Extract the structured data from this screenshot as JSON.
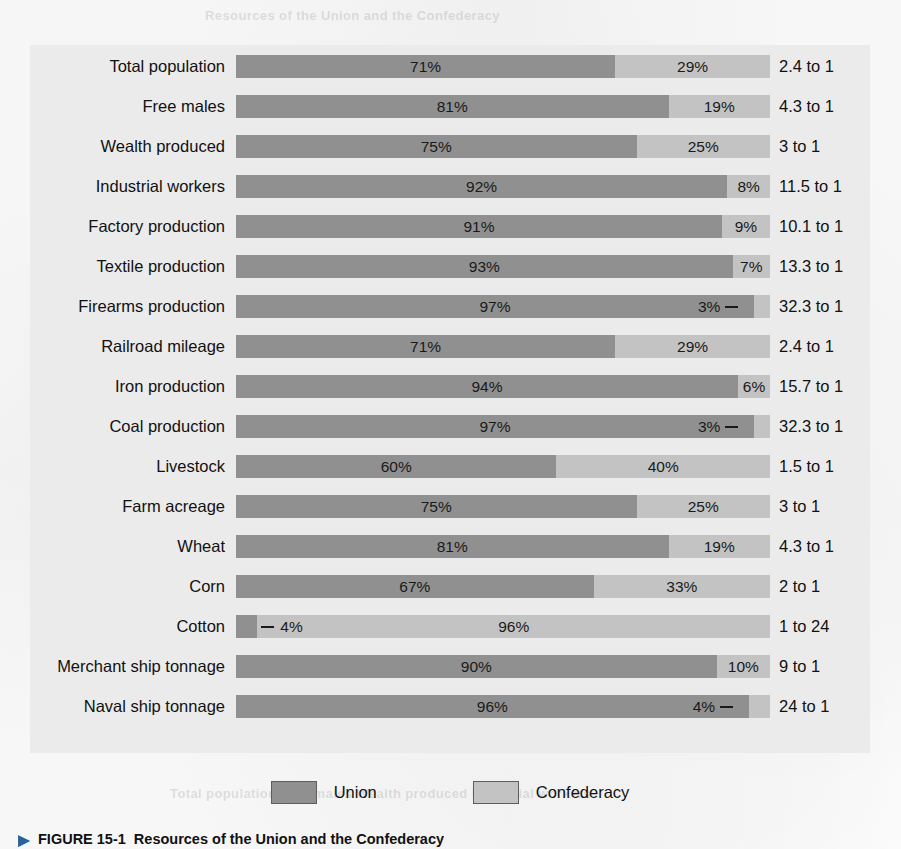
{
  "chart_data": {
    "type": "bar",
    "subtype": "stacked-horizontal-100percent",
    "title": "Resources of the Union and the Confederacy",
    "xlabel": "",
    "ylabel": "",
    "xlim": [
      0,
      100
    ],
    "grid": false,
    "legend_position": "bottom-center",
    "categories": [
      "Total population",
      "Free males",
      "Wealth produced",
      "Industrial workers",
      "Factory production",
      "Textile production",
      "Firearms production",
      "Railroad mileage",
      "Iron production",
      "Coal production",
      "Livestock",
      "Farm acreage",
      "Wheat",
      "Corn",
      "Cotton",
      "Merchant ship tonnage",
      "Naval ship tonnage"
    ],
    "series": [
      {
        "name": "Union",
        "color": "#909090",
        "values": [
          71,
          81,
          75,
          92,
          91,
          93,
          97,
          71,
          94,
          97,
          60,
          75,
          81,
          67,
          4,
          90,
          96
        ]
      },
      {
        "name": "Confederacy",
        "color": "#c3c3c3",
        "values": [
          29,
          19,
          25,
          8,
          9,
          7,
          3,
          29,
          6,
          3,
          40,
          25,
          19,
          33,
          96,
          10,
          4
        ]
      }
    ],
    "ratios": [
      "2.4 to 1",
      "4.3 to 1",
      "3 to 1",
      "11.5 to 1",
      "10.1 to 1",
      "13.3 to 1",
      "32.3 to 1",
      "2.4 to 1",
      "15.7 to 1",
      "32.3 to 1",
      "1.5 to 1",
      "3 to 1",
      "4.3 to 1",
      "2 to 1",
      "1 to 24",
      "9 to 1",
      "24 to 1"
    ]
  },
  "rows": [
    {
      "label": "Total population",
      "union": 71,
      "conf": 29,
      "union_pct_text": "71%",
      "conf_pct_text": "29%",
      "ratio": "2.4 to 1",
      "union_label_outside": false,
      "conf_label_outside": false,
      "conf_leader": false,
      "union_leader": false
    },
    {
      "label": "Free males",
      "union": 81,
      "conf": 19,
      "union_pct_text": "81%",
      "conf_pct_text": "19%",
      "ratio": "4.3 to 1",
      "union_label_outside": false,
      "conf_label_outside": false,
      "conf_leader": false,
      "union_leader": false
    },
    {
      "label": "Wealth produced",
      "union": 75,
      "conf": 25,
      "union_pct_text": "75%",
      "conf_pct_text": "25%",
      "ratio": "3 to 1",
      "union_label_outside": false,
      "conf_label_outside": false,
      "conf_leader": false,
      "union_leader": false
    },
    {
      "label": "Industrial workers",
      "union": 92,
      "conf": 8,
      "union_pct_text": "92%",
      "conf_pct_text": "8%",
      "ratio": "11.5 to 1",
      "union_label_outside": false,
      "conf_label_outside": false,
      "conf_leader": false,
      "union_leader": false
    },
    {
      "label": "Factory production",
      "union": 91,
      "conf": 9,
      "union_pct_text": "91%",
      "conf_pct_text": "9%",
      "ratio": "10.1 to 1",
      "union_label_outside": false,
      "conf_label_outside": false,
      "conf_leader": false,
      "union_leader": false
    },
    {
      "label": "Textile production",
      "union": 93,
      "conf": 7,
      "union_pct_text": "93%",
      "conf_pct_text": "7%",
      "ratio": "13.3 to 1",
      "union_label_outside": false,
      "conf_label_outside": false,
      "conf_leader": false,
      "union_leader": false
    },
    {
      "label": "Firearms production",
      "union": 97,
      "conf": 3,
      "union_pct_text": "97%",
      "conf_pct_text": "3%",
      "ratio": "32.3 to 1",
      "union_label_outside": false,
      "conf_label_outside": true,
      "conf_leader": true,
      "union_leader": false
    },
    {
      "label": "Railroad mileage",
      "union": 71,
      "conf": 29,
      "union_pct_text": "71%",
      "conf_pct_text": "29%",
      "ratio": "2.4 to 1",
      "union_label_outside": false,
      "conf_label_outside": false,
      "conf_leader": false,
      "union_leader": false
    },
    {
      "label": "Iron production",
      "union": 94,
      "conf": 6,
      "union_pct_text": "94%",
      "conf_pct_text": "6%",
      "ratio": "15.7 to 1",
      "union_label_outside": false,
      "conf_label_outside": false,
      "conf_leader": false,
      "union_leader": false
    },
    {
      "label": "Coal production",
      "union": 97,
      "conf": 3,
      "union_pct_text": "97%",
      "conf_pct_text": "3%",
      "ratio": "32.3 to 1",
      "union_label_outside": false,
      "conf_label_outside": true,
      "conf_leader": true,
      "union_leader": false
    },
    {
      "label": "Livestock",
      "union": 60,
      "conf": 40,
      "union_pct_text": "60%",
      "conf_pct_text": "40%",
      "ratio": "1.5 to 1",
      "union_label_outside": false,
      "conf_label_outside": false,
      "conf_leader": false,
      "union_leader": false
    },
    {
      "label": "Farm acreage",
      "union": 75,
      "conf": 25,
      "union_pct_text": "75%",
      "conf_pct_text": "25%",
      "ratio": "3 to 1",
      "union_label_outside": false,
      "conf_label_outside": false,
      "conf_leader": false,
      "union_leader": false
    },
    {
      "label": "Wheat",
      "union": 81,
      "conf": 19,
      "union_pct_text": "81%",
      "conf_pct_text": "19%",
      "ratio": "4.3 to 1",
      "union_label_outside": false,
      "conf_label_outside": false,
      "conf_leader": false,
      "union_leader": false
    },
    {
      "label": "Corn",
      "union": 67,
      "conf": 33,
      "union_pct_text": "67%",
      "conf_pct_text": "33%",
      "ratio": "2 to 1",
      "union_label_outside": false,
      "conf_label_outside": false,
      "conf_leader": false,
      "union_leader": false
    },
    {
      "label": "Cotton",
      "union": 4,
      "conf": 96,
      "union_pct_text": "4%",
      "conf_pct_text": "96%",
      "ratio": "1 to 24",
      "union_label_outside": true,
      "conf_label_outside": false,
      "conf_leader": false,
      "union_leader": true
    },
    {
      "label": "Merchant ship tonnage",
      "union": 90,
      "conf": 10,
      "union_pct_text": "90%",
      "conf_pct_text": "10%",
      "ratio": "9 to 1",
      "union_label_outside": false,
      "conf_label_outside": false,
      "conf_leader": false,
      "union_leader": false
    },
    {
      "label": "Naval ship tonnage",
      "union": 96,
      "conf": 4,
      "union_pct_text": "96%",
      "conf_pct_text": "4%",
      "ratio": "24 to 1",
      "union_label_outside": false,
      "conf_label_outside": true,
      "conf_leader": true,
      "union_leader": false
    }
  ],
  "legend": {
    "union_label": "Union",
    "confederacy_label": "Confederacy"
  },
  "caption": {
    "marker": "▶",
    "figure_number": "FIGURE 15-1",
    "text": "Resources of the Union and the Confederacy"
  },
  "colors": {
    "union": "#909090",
    "confederacy": "#c3c3c3",
    "panel_background": "#ebebeb",
    "page_background": "#fdfdfd",
    "text": "#111111"
  }
}
